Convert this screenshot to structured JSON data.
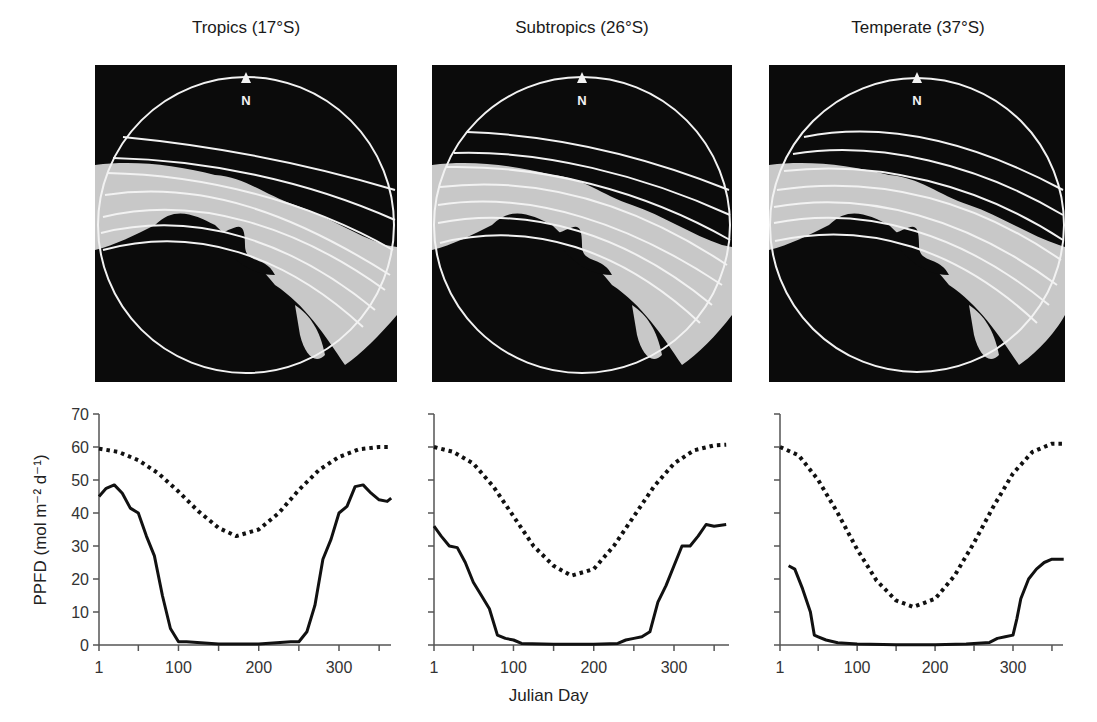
{
  "figure": {
    "panels": [
      {
        "title": "Tropics (17°S)",
        "compass_label": "N"
      },
      {
        "title": "Subtropics (26°S)",
        "compass_label": "N"
      },
      {
        "title": "Temperate (37°S)",
        "compass_label": "N"
      }
    ],
    "ylabel": "PPFD (mol m⁻² d⁻¹)",
    "xlabel": "Julian Day",
    "yticks": [
      "0",
      "10",
      "20",
      "30",
      "40",
      "50",
      "60",
      "70"
    ],
    "xticks": [
      "1",
      "100",
      "200",
      "300"
    ]
  },
  "colors": {
    "photo_background": "#0b0b0b",
    "canopy_gap": "#c8c8c8",
    "sun_track": "#f2f2f2",
    "series": "#111111"
  },
  "chart_data": [
    {
      "type": "line",
      "title": "Tropics (17°S)",
      "xlabel": "Julian Day",
      "ylabel": "PPFD (mol m-2 d-1)",
      "xlim": [
        1,
        365
      ],
      "ylim": [
        0,
        70
      ],
      "xticks": [
        1,
        50,
        100,
        150,
        200,
        250,
        300,
        350
      ],
      "xticklabels": [
        "1",
        "100",
        "200",
        "300"
      ],
      "yticks": [
        0,
        10,
        20,
        30,
        40,
        50,
        60,
        70
      ],
      "grid": false,
      "series": [
        {
          "name": "Above-canopy potential PPFD",
          "style": "dotted",
          "x": [
            1,
            25,
            50,
            75,
            100,
            125,
            150,
            172,
            200,
            225,
            250,
            275,
            300,
            325,
            350,
            365
          ],
          "values": [
            59.5,
            58.5,
            56,
            52,
            46.5,
            40.5,
            35.5,
            33,
            35,
            40,
            47,
            53,
            57,
            59.3,
            60,
            60
          ]
        },
        {
          "name": "Understorey PPFD",
          "style": "solid",
          "x": [
            1,
            10,
            20,
            30,
            40,
            50,
            60,
            70,
            80,
            90,
            100,
            110,
            150,
            200,
            240,
            250,
            260,
            270,
            280,
            290,
            300,
            310,
            320,
            330,
            340,
            350,
            360,
            365
          ],
          "values": [
            45,
            47.5,
            48.5,
            46,
            41.5,
            40,
            33,
            27,
            15,
            5,
            1,
            1,
            0.3,
            0.3,
            1,
            1,
            4,
            12,
            26,
            32,
            40,
            42,
            48,
            48.5,
            46,
            44,
            43.5,
            44.5
          ]
        }
      ]
    },
    {
      "type": "line",
      "title": "Subtropics (26°S)",
      "xlabel": "Julian Day",
      "ylabel": "PPFD (mol m-2 d-1)",
      "xlim": [
        1,
        365
      ],
      "ylim": [
        0,
        70
      ],
      "xticks": [
        1,
        50,
        100,
        150,
        200,
        250,
        300,
        350
      ],
      "xticklabels": [
        "1",
        "100",
        "200",
        "300"
      ],
      "yticks": [
        0,
        10,
        20,
        30,
        40,
        50,
        60,
        70
      ],
      "grid": false,
      "series": [
        {
          "name": "Above-canopy potential PPFD",
          "style": "dotted",
          "x": [
            1,
            25,
            50,
            75,
            100,
            125,
            150,
            172,
            200,
            225,
            250,
            275,
            300,
            325,
            350,
            365
          ],
          "values": [
            60,
            58.5,
            55,
            48,
            39,
            30,
            24,
            21,
            23,
            30,
            39,
            48,
            55,
            59,
            60.5,
            60.7
          ]
        },
        {
          "name": "Understorey PPFD",
          "style": "solid",
          "x": [
            1,
            10,
            20,
            30,
            40,
            50,
            60,
            70,
            80,
            90,
            100,
            110,
            150,
            200,
            230,
            240,
            250,
            260,
            270,
            280,
            290,
            300,
            310,
            320,
            330,
            340,
            350,
            365
          ],
          "values": [
            36,
            33,
            30,
            29.5,
            25,
            19,
            15,
            11,
            3,
            2,
            1.5,
            0.5,
            0.2,
            0.2,
            0.5,
            1.5,
            2,
            2.5,
            4,
            13,
            18,
            24,
            30,
            30,
            33,
            36.5,
            36,
            36.5
          ]
        }
      ]
    },
    {
      "type": "line",
      "title": "Temperate (37°S)",
      "xlabel": "Julian Day",
      "ylabel": "PPFD (mol m-2 d-1)",
      "xlim": [
        1,
        365
      ],
      "ylim": [
        0,
        70
      ],
      "xticks": [
        1,
        50,
        100,
        150,
        200,
        250,
        300,
        350
      ],
      "xticklabels": [
        "1",
        "100",
        "200",
        "300"
      ],
      "yticks": [
        0,
        10,
        20,
        30,
        40,
        50,
        60,
        70
      ],
      "grid": false,
      "series": [
        {
          "name": "Above-canopy potential PPFD",
          "style": "dotted",
          "x": [
            1,
            25,
            50,
            75,
            100,
            125,
            150,
            172,
            200,
            225,
            250,
            275,
            300,
            325,
            350,
            365
          ],
          "values": [
            60,
            57.5,
            50,
            40,
            29,
            19.5,
            13.5,
            11.5,
            14,
            21,
            31,
            42,
            52,
            58.5,
            61,
            61
          ]
        },
        {
          "name": "Understorey PPFD",
          "style": "solid",
          "x": [
            12,
            20,
            30,
            40,
            45,
            50,
            60,
            75,
            100,
            150,
            200,
            240,
            260,
            270,
            280,
            290,
            300,
            305,
            310,
            320,
            330,
            340,
            350,
            365
          ],
          "values": [
            24,
            23,
            17,
            10,
            3,
            2.5,
            1.5,
            0.7,
            0.3,
            0.1,
            0.1,
            0.3,
            0.6,
            0.8,
            2,
            2.5,
            3,
            8,
            14,
            20,
            23,
            25,
            26,
            26
          ]
        }
      ]
    }
  ]
}
